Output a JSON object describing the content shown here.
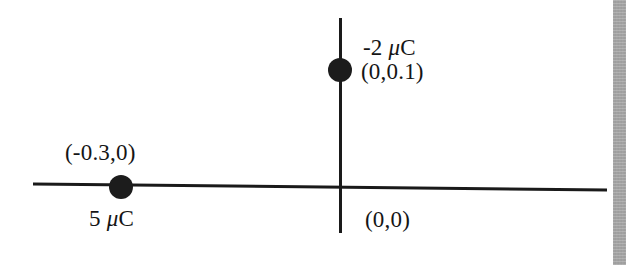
{
  "figure": {
    "type": "physics-diagram",
    "background_color": "#ffffff",
    "ink_color": "#151515",
    "width": 637,
    "height": 265
  },
  "axes": {
    "x_axis": {
      "name": "horizontal-axis",
      "x1": 33,
      "y1": 184,
      "x2": 607,
      "y2": 190,
      "stroke_width": 3,
      "color": "#1a1a1a"
    },
    "y_axis": {
      "name": "vertical-axis",
      "x1": 340,
      "y1": 18,
      "x2": 341,
      "y2": 233,
      "stroke_width": 3,
      "color": "#1a1a1a"
    },
    "origin": {
      "x": 340,
      "y": 187
    }
  },
  "charges": [
    {
      "id": "charge-top",
      "charge_label": "-2 ",
      "charge_unit": "C",
      "charge_value": -2,
      "charge_units": "microcoulomb",
      "position_label": "(0,0.1)",
      "coordinates": [
        0,
        0.1
      ],
      "marker": {
        "cx": 340,
        "cy": 70,
        "rx": 12,
        "ry": 12,
        "color": "#1c1c1c"
      }
    },
    {
      "id": "charge-left",
      "charge_label": "5 ",
      "charge_unit": "C",
      "charge_value": 5,
      "charge_units": "microcoulomb",
      "position_label": "(-0.3,0)",
      "coordinates": [
        -0.3,
        0
      ],
      "marker": {
        "cx": 121,
        "cy": 187,
        "rx": 12,
        "ry": 12,
        "color": "#1c1c1c"
      }
    }
  ],
  "labels": {
    "charge_top": "-2 ",
    "charge_top_unit": "C",
    "position_top": "(0,0.1)",
    "position_left": "(-0.3,0)",
    "charge_left": "5 ",
    "charge_left_unit": "C",
    "origin": "(0,0)",
    "mu": "μ"
  },
  "artifact": {
    "name": "scan-edge-band",
    "color": "#a0a0a0",
    "x": 613,
    "width": 13
  },
  "chart_data": {
    "type": "scatter",
    "title": "",
    "xlabel": "",
    "ylabel": "",
    "grid": false,
    "legend": "none",
    "annotations": [
      "-2 μC",
      "(0,0.1)",
      "(-0.3,0)",
      "5 μC",
      "(0,0)"
    ],
    "points": [
      {
        "label": "-2 μC",
        "x": 0,
        "y": 0.1,
        "coord_text": "(0,0.1)"
      },
      {
        "label": "5 μC",
        "x": -0.3,
        "y": 0,
        "coord_text": "(-0.3,0)"
      }
    ],
    "origin_label": "(0,0)"
  }
}
